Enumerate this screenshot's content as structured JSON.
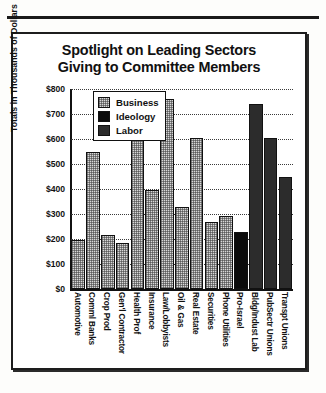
{
  "chart_data": {
    "type": "bar",
    "title": "Spotlight on Leading Sectors Giving to Committee Members",
    "title_lines": [
      "Spotlight on Leading Sectors",
      "Giving to Committee Members"
    ],
    "xlabel": "",
    "ylabel": "Totals in Thousands of Dollars",
    "ylim": [
      0,
      800
    ],
    "ytick_labels": [
      "$800",
      "$700",
      "$600",
      "$500",
      "$400",
      "$300",
      "$200",
      "$100",
      "$0"
    ],
    "ytick_values": [
      800,
      700,
      600,
      500,
      400,
      300,
      200,
      100,
      0
    ],
    "grid": true,
    "grid_axis": "y",
    "legend_position": "upper-left-inside",
    "legend": [
      {
        "name": "Business",
        "color": "#d7d7d7",
        "pattern": "light-stipple"
      },
      {
        "name": "Ideology",
        "color": "#0b0b0b",
        "pattern": "solid-black"
      },
      {
        "name": "Labor",
        "color": "#8f8f8f",
        "pattern": "dark-stipple"
      }
    ],
    "categories": [
      "Automotive",
      "Comml Banks",
      "Crop Prod",
      "Gen'l Contractor",
      "Health Prof",
      "Insurance",
      "Law/Lobbyists",
      "Oil & Gas",
      "Real Estate",
      "Securities",
      "Phone Utilities",
      "Pro-Israel",
      "Bldg/Indust Lab",
      "PubSectr Unions",
      "Transpt Unions"
    ],
    "values": [
      195,
      550,
      215,
      185,
      610,
      395,
      760,
      330,
      605,
      270,
      293,
      228,
      740,
      605,
      450
    ],
    "bar_series": [
      "Business",
      "Business",
      "Business",
      "Business",
      "Business",
      "Business",
      "Business",
      "Business",
      "Business",
      "Business",
      "Business",
      "Ideology",
      "Labor",
      "Labor",
      "Labor"
    ],
    "units": "thousands of dollars"
  }
}
